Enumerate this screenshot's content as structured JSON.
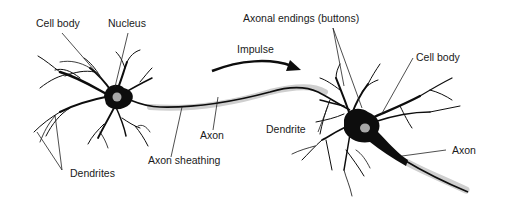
{
  "diagram": {
    "colors": {
      "neuron": "#0d0d0d",
      "nucleus": "#a8a8a8",
      "sheath": "#c8c8c8",
      "leader": "#222222",
      "background": "#ffffff"
    },
    "labels": {
      "left_cell_body": "Cell body",
      "left_nucleus": "Nucleus",
      "dendrites": "Dendrites",
      "axon": "Axon",
      "axon_sheathing": "Axon sheathing",
      "impulse": "Impulse",
      "axonal_endings": "Axonal endings (buttons)",
      "right_cell_body": "Cell body",
      "dendrite": "Dendrite",
      "right_axon": "Axon"
    }
  }
}
